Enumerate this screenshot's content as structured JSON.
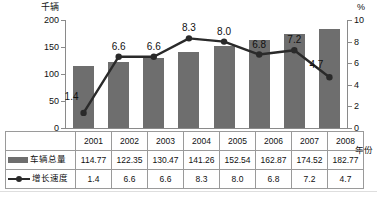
{
  "chart_data": {
    "type": "bar",
    "title": "",
    "categories": [
      "2001",
      "2002",
      "2003",
      "2004",
      "2005",
      "2006",
      "2007",
      "2008"
    ],
    "xlabel": "年份",
    "ylabel": "千辆",
    "y2label": "%",
    "ylim": [
      0,
      200
    ],
    "y2lim": [
      0,
      10
    ],
    "yticks": [
      "0",
      "50",
      "100",
      "150",
      "200"
    ],
    "y2ticks": [
      "0",
      "2",
      "4",
      "6",
      "8",
      "10"
    ],
    "grid": false,
    "legend_position": "table-left",
    "series": [
      {
        "name": "车辆总量",
        "type": "bar",
        "axis": "left",
        "color": "#6e6e6e",
        "values": [
          114.77,
          122.35,
          130.47,
          141.26,
          152.54,
          162.87,
          174.52,
          182.77
        ],
        "value_labels": [
          "114.77",
          "122.35",
          "130.47",
          "141.26",
          "152.54",
          "162.87",
          "174.52",
          "182.77"
        ]
      },
      {
        "name": "增长速度",
        "type": "line",
        "axis": "right",
        "color": "#2a2a2a",
        "marker": "circle",
        "values": [
          1.4,
          6.6,
          6.6,
          8.3,
          8.0,
          6.8,
          7.2,
          4.7
        ],
        "value_labels": [
          "1.4",
          "6.6",
          "6.6",
          "8.3",
          "8.0",
          "6.8",
          "7.2",
          "4.7"
        ]
      }
    ]
  },
  "axes": {
    "left_unit": "千辆",
    "right_unit": "%",
    "x_unit": "年份"
  },
  "table": {
    "year_header": [
      "2001",
      "2002",
      "2003",
      "2004",
      "2005",
      "2006",
      "2007",
      "2008"
    ],
    "rows": [
      {
        "label": "车辆总量",
        "swatch": "bar-swatch",
        "values": [
          "114.77",
          "122.35",
          "130.47",
          "141.26",
          "152.54",
          "162.87",
          "174.52",
          "182.77"
        ]
      },
      {
        "label": "增长速度",
        "swatch": "line-marker-swatch",
        "values": [
          "1.4",
          "6.6",
          "6.6",
          "8.3",
          "8.0",
          "6.8",
          "7.2",
          "4.7"
        ]
      }
    ]
  },
  "colors": {
    "bar": "#6e6e6e",
    "line": "#2a2a2a",
    "axis": "#8a8a8a",
    "grid_border": "#9a9a9a",
    "text": "#111111",
    "background": "#ffffff"
  }
}
